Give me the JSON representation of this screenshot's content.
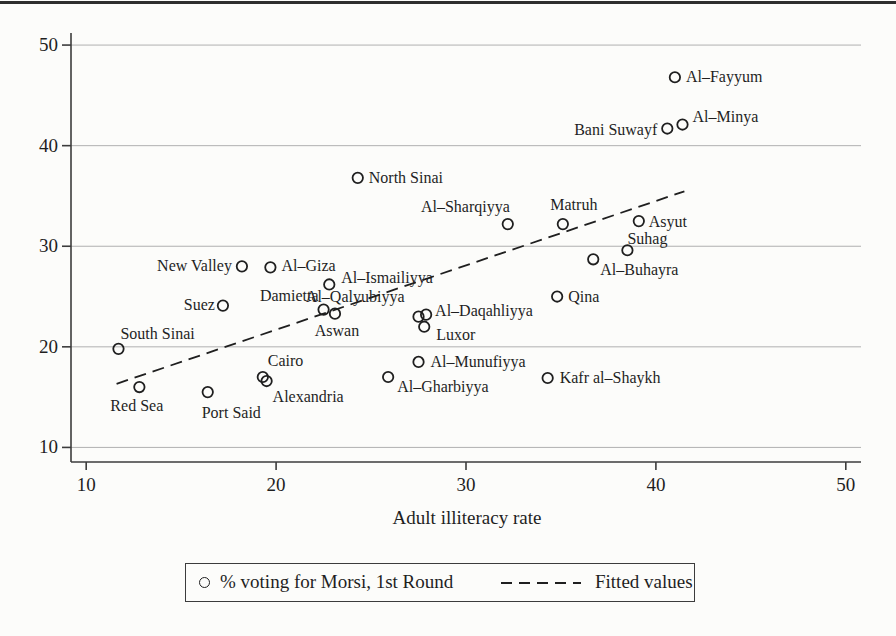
{
  "colors": {
    "ink": "#1f1f1f",
    "axis": "#3c3c3c",
    "grid": "#b0b0b0",
    "background": "#fcfcfa"
  },
  "legend": {
    "marker_label": "% voting for Morsi, 1st Round",
    "line_label": "Fitted values"
  },
  "chart_data": {
    "type": "scatter",
    "title": "",
    "xlabel": "Adult illiteracy rate",
    "ylabel": "",
    "xlim": [
      9.2,
      50.8
    ],
    "ylim": [
      8.55,
      51.2
    ],
    "x_ticks": [
      10,
      20,
      30,
      40,
      50
    ],
    "y_ticks": [
      10,
      20,
      30,
      40,
      50
    ],
    "grid": "horizontal-only",
    "legend_position": "bottom-center-boxed",
    "series": [
      {
        "name": "% voting for Morsi, 1st Round",
        "marker": "hollow-circle",
        "points": [
          {
            "name": "South Sinai",
            "x": 11.7,
            "y": 19.8,
            "anchor": "start",
            "dx": 2,
            "dy": -15
          },
          {
            "name": "Red Sea",
            "x": 12.8,
            "y": 16.0,
            "anchor": "start",
            "dx": -29,
            "dy": 19
          },
          {
            "name": "Port Said",
            "x": 16.4,
            "y": 15.5,
            "anchor": "start",
            "dx": -6,
            "dy": 21
          },
          {
            "name": "Suez",
            "x": 17.2,
            "y": 24.1,
            "anchor": "end",
            "dx": -8,
            "dy": -1
          },
          {
            "name": "New Valley",
            "x": 18.2,
            "y": 28.0,
            "anchor": "end",
            "dx": -10,
            "dy": 0
          },
          {
            "name": "Al–Giza",
            "x": 19.7,
            "y": 27.9,
            "anchor": "start",
            "dx": 11,
            "dy": -1
          },
          {
            "name": "Cairo",
            "x": 19.3,
            "y": 17.0,
            "anchor": "start",
            "dx": 5,
            "dy": -16
          },
          {
            "name": "Alexandria",
            "x": 19.5,
            "y": 16.6,
            "anchor": "start",
            "dx": 6,
            "dy": 16
          },
          {
            "name": "Damietta",
            "x": 22.5,
            "y": 23.7,
            "anchor": "end",
            "dx": -5,
            "dy": -14
          },
          {
            "name": "Aswan",
            "x": 23.1,
            "y": 23.3,
            "anchor": "middle",
            "dx": 2,
            "dy": 17
          },
          {
            "name": "Al–Ismailiyya",
            "x": 22.8,
            "y": 26.2,
            "anchor": "start",
            "dx": 12,
            "dy": -6
          },
          {
            "name": "North Sinai",
            "x": 24.3,
            "y": 36.8,
            "anchor": "start",
            "dx": 11,
            "dy": 0
          },
          {
            "name": "Al–Gharbiyya",
            "x": 25.9,
            "y": 17.0,
            "anchor": "start",
            "dx": 9,
            "dy": 10
          },
          {
            "name": "Al–Munufiyya",
            "x": 27.5,
            "y": 18.5,
            "anchor": "start",
            "dx": 12,
            "dy": 0
          },
          {
            "name": "Al–Qalyubiyya",
            "x": 27.5,
            "y": 23.0,
            "anchor": "end",
            "dx": -14,
            "dy": -20
          },
          {
            "name": "Al–Daqahliyya",
            "x": 27.9,
            "y": 23.2,
            "anchor": "start",
            "dx": 9,
            "dy": -4
          },
          {
            "name": "Luxor",
            "x": 27.8,
            "y": 22.0,
            "anchor": "start",
            "dx": 12,
            "dy": 8
          },
          {
            "name": "Al–Sharqiyya",
            "x": 32.2,
            "y": 32.2,
            "anchor": "end",
            "dx": 2,
            "dy": -17
          },
          {
            "name": "Kafr al–Shaykh",
            "x": 34.3,
            "y": 16.9,
            "anchor": "start",
            "dx": 12,
            "dy": 0
          },
          {
            "name": "Qina",
            "x": 34.8,
            "y": 25.0,
            "anchor": "start",
            "dx": 11,
            "dy": 0
          },
          {
            "name": "Matruh",
            "x": 35.1,
            "y": 32.2,
            "anchor": "middle",
            "dx": 11,
            "dy": -19
          },
          {
            "name": "Al–Buhayra",
            "x": 36.7,
            "y": 28.7,
            "anchor": "start",
            "dx": 7,
            "dy": 11
          },
          {
            "name": "Suhag",
            "x": 38.5,
            "y": 29.6,
            "anchor": "start",
            "dx": 0,
            "dy": -11
          },
          {
            "name": "Asyut",
            "x": 39.1,
            "y": 32.5,
            "anchor": "start",
            "dx": 10,
            "dy": 1
          },
          {
            "name": "Bani Suwayf",
            "x": 40.6,
            "y": 41.7,
            "anchor": "end",
            "dx": -10,
            "dy": 1
          },
          {
            "name": "Al–Fayyum",
            "x": 41.0,
            "y": 46.8,
            "anchor": "start",
            "dx": 11,
            "dy": 0
          },
          {
            "name": "Al–Minya",
            "x": 41.4,
            "y": 42.1,
            "anchor": "start",
            "dx": 10,
            "dy": -8
          }
        ]
      }
    ],
    "fitted_line": {
      "name": "Fitted values",
      "style": "dashed",
      "slope": 0.64,
      "intercept": 8.9,
      "x_start": 11.6,
      "x_end": 41.5
    }
  }
}
